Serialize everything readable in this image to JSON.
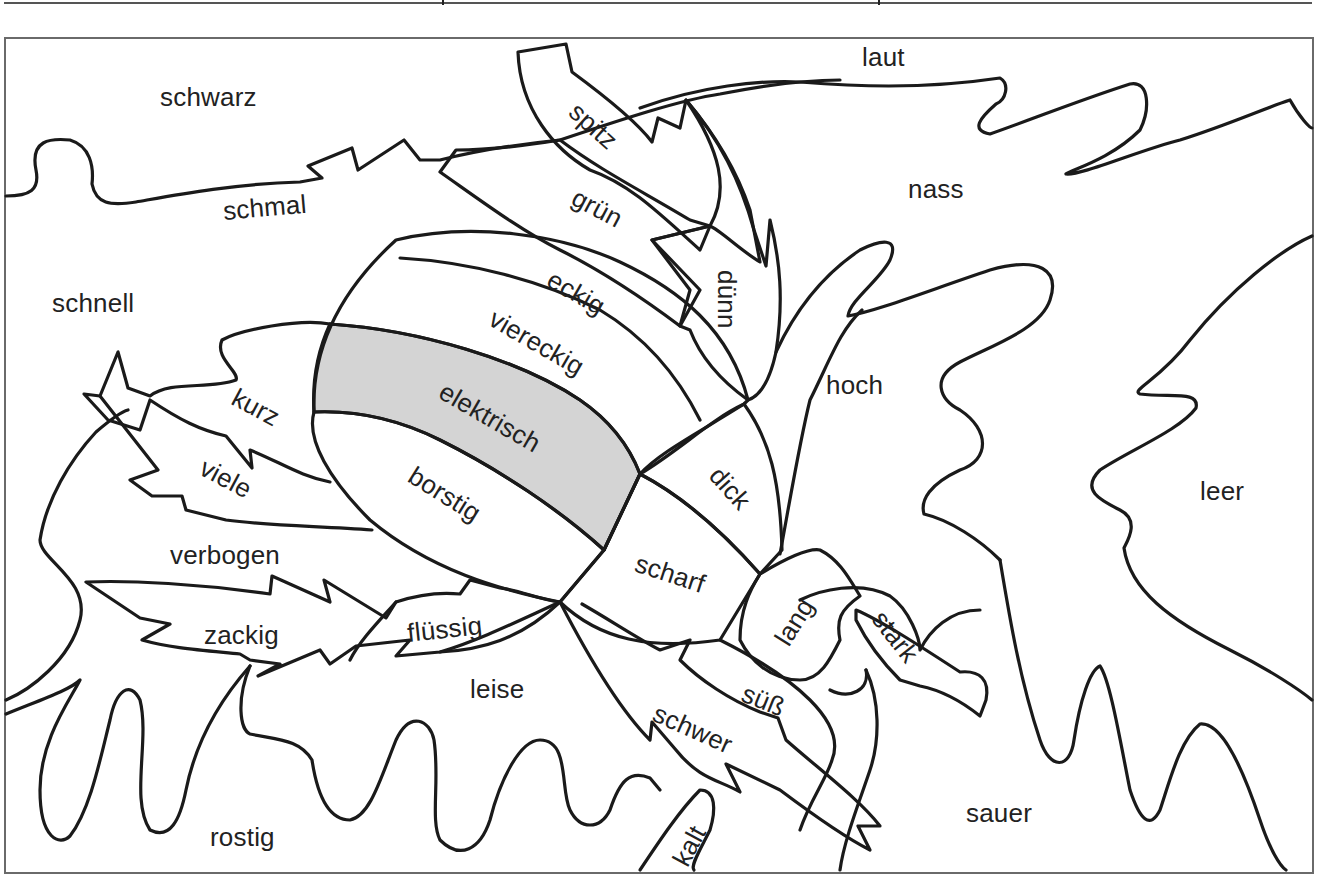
{
  "worksheet": {
    "type": "color-by-word puzzle",
    "hidden_figure": "beetle",
    "colors": {
      "line": "#1a1a1a",
      "frame": "#6a6a6a",
      "shaded_fill": "#d4d4d4",
      "background": "#ffffff",
      "text": "#222222"
    },
    "shaded_regions": [
      "elektrisch"
    ],
    "words": [
      {
        "id": "schwarz",
        "text": "schwarz",
        "x": 160,
        "y": 84,
        "rot": 0
      },
      {
        "id": "laut",
        "text": "laut",
        "x": 862,
        "y": 44,
        "rot": 0
      },
      {
        "id": "spitz",
        "text": "spitz",
        "x": 582,
        "y": 98,
        "rot": 42
      },
      {
        "id": "gruen",
        "text": "grün",
        "x": 580,
        "y": 184,
        "rot": 28
      },
      {
        "id": "nass",
        "text": "nass",
        "x": 908,
        "y": 176,
        "rot": 0
      },
      {
        "id": "schmal",
        "text": "schmal",
        "x": 222,
        "y": 198,
        "rot": -5
      },
      {
        "id": "eckig",
        "text": "eckig",
        "x": 556,
        "y": 266,
        "rot": 30
      },
      {
        "id": "duenn",
        "text": "dünn",
        "x": 740,
        "y": 270,
        "rot": 90
      },
      {
        "id": "schnell",
        "text": "schnell",
        "x": 52,
        "y": 290,
        "rot": 0
      },
      {
        "id": "viereckig",
        "text": "viereckig",
        "x": 498,
        "y": 305,
        "rot": 30
      },
      {
        "id": "hoch",
        "text": "hoch",
        "x": 826,
        "y": 372,
        "rot": 0
      },
      {
        "id": "elektrisch",
        "text": "elektrisch",
        "x": 448,
        "y": 378,
        "rot": 30
      },
      {
        "id": "kurz",
        "text": "kurz",
        "x": 240,
        "y": 384,
        "rot": 28
      },
      {
        "id": "viele",
        "text": "viele",
        "x": 208,
        "y": 454,
        "rot": 28
      },
      {
        "id": "dick",
        "text": "dick",
        "x": 724,
        "y": 462,
        "rot": 48
      },
      {
        "id": "leer",
        "text": "leer",
        "x": 1200,
        "y": 478,
        "rot": 0
      },
      {
        "id": "borstig",
        "text": "borstig",
        "x": 418,
        "y": 462,
        "rot": 32
      },
      {
        "id": "verbogen",
        "text": "verbogen",
        "x": 170,
        "y": 542,
        "rot": 0
      },
      {
        "id": "scharf",
        "text": "scharf",
        "x": 640,
        "y": 550,
        "rot": 18
      },
      {
        "id": "lang",
        "text": "lang",
        "x": 770,
        "y": 636,
        "rot": -58
      },
      {
        "id": "stark",
        "text": "stark",
        "x": 888,
        "y": 606,
        "rot": 52
      },
      {
        "id": "zackig",
        "text": "zackig",
        "x": 204,
        "y": 622,
        "rot": 0
      },
      {
        "id": "fluessig",
        "text": "flüssig",
        "x": 406,
        "y": 620,
        "rot": -6
      },
      {
        "id": "leise",
        "text": "leise",
        "x": 470,
        "y": 676,
        "rot": 0
      },
      {
        "id": "suess",
        "text": "süß",
        "x": 748,
        "y": 680,
        "rot": 22
      },
      {
        "id": "schwer",
        "text": "schwer",
        "x": 660,
        "y": 700,
        "rot": 24
      },
      {
        "id": "sauer",
        "text": "sauer",
        "x": 966,
        "y": 800,
        "rot": 0
      },
      {
        "id": "rostig",
        "text": "rostig",
        "x": 210,
        "y": 824,
        "rot": 0
      },
      {
        "id": "kalt",
        "text": "kalt",
        "x": 668,
        "y": 858,
        "rot": -62
      }
    ]
  }
}
